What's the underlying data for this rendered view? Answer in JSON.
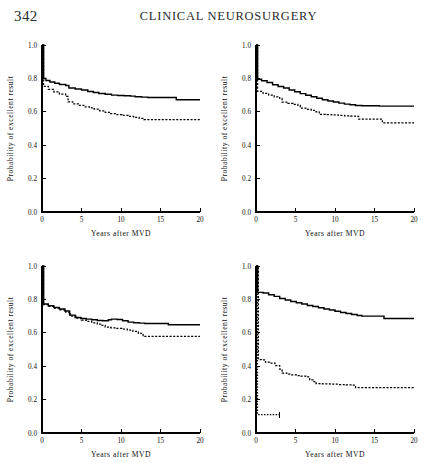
{
  "header": {
    "folio": "342",
    "running_head": "CLINICAL NEUROSURGERY"
  },
  "axes": {
    "xlabel": "Years after MVD",
    "ylabel": "Probability of excellent result",
    "xticks": [
      "0",
      "5",
      "10",
      "15",
      "20"
    ],
    "yticks": [
      "0.0",
      "0.2",
      "0.4",
      "0.6",
      "0.8",
      "1.0"
    ],
    "xlim": [
      0,
      20
    ],
    "ylim": [
      0,
      1
    ]
  },
  "chart_data": [
    {
      "type": "line",
      "panel": "top-left",
      "title": "",
      "xlabel": "Years after MVD",
      "ylabel": "Probability of excellent result",
      "xlim": [
        0,
        20
      ],
      "ylim": [
        0,
        1
      ],
      "grid": false,
      "legend": "none",
      "series": [
        {
          "name": "curve-solid",
          "style": "solid",
          "x": [
            0,
            0.2,
            0.5,
            1.0,
            1.6,
            2.2,
            3.0,
            3.4,
            4.2,
            5.0,
            5.8,
            6.5,
            7.2,
            8.0,
            8.8,
            9.6,
            10.4,
            11.2,
            11.8,
            12.6,
            13.4,
            15.6,
            17.0,
            20.0
          ],
          "y": [
            1.0,
            0.8,
            0.787,
            0.779,
            0.771,
            0.764,
            0.757,
            0.742,
            0.737,
            0.73,
            0.722,
            0.716,
            0.71,
            0.705,
            0.7,
            0.698,
            0.696,
            0.694,
            0.69,
            0.688,
            0.686,
            0.686,
            0.672,
            0.672
          ]
        },
        {
          "name": "curve-dashed",
          "style": "dashed",
          "x": [
            0,
            0.2,
            0.8,
            1.5,
            2.2,
            3.0,
            3.3,
            3.9,
            4.6,
            5.3,
            6.0,
            6.6,
            7.3,
            8.0,
            8.7,
            9.4,
            10.1,
            10.9,
            11.6,
            12.3,
            12.9,
            13.4,
            20.0
          ],
          "y": [
            1.0,
            0.752,
            0.735,
            0.72,
            0.706,
            0.692,
            0.66,
            0.648,
            0.638,
            0.63,
            0.624,
            0.616,
            0.606,
            0.597,
            0.589,
            0.583,
            0.578,
            0.572,
            0.566,
            0.56,
            0.553,
            0.553,
            0.553
          ]
        }
      ]
    },
    {
      "type": "line",
      "panel": "top-right",
      "title": "",
      "xlabel": "Years after MVD",
      "ylabel": "Probability of excellent result",
      "xlim": [
        0,
        20
      ],
      "ylim": [
        0,
        1
      ],
      "grid": false,
      "legend": "none",
      "series": [
        {
          "name": "curve-solid",
          "style": "solid",
          "x": [
            0,
            0.2,
            0.7,
            1.4,
            2.1,
            2.8,
            3.5,
            4.2,
            4.9,
            5.6,
            6.3,
            7.0,
            7.7,
            8.4,
            9.1,
            9.8,
            10.5,
            11.2,
            11.9,
            12.6,
            13.4,
            15.6,
            20.0
          ],
          "y": [
            1.0,
            0.795,
            0.786,
            0.775,
            0.762,
            0.751,
            0.742,
            0.731,
            0.72,
            0.709,
            0.699,
            0.69,
            0.681,
            0.672,
            0.665,
            0.659,
            0.652,
            0.646,
            0.642,
            0.638,
            0.636,
            0.634,
            0.634
          ]
        },
        {
          "name": "curve-dashed",
          "style": "dashed",
          "x": [
            0,
            0.2,
            0.9,
            1.6,
            2.3,
            3.0,
            3.3,
            4.0,
            4.7,
            5.3,
            5.6,
            6.3,
            7.0,
            7.6,
            8.0,
            8.8,
            9.6,
            10.4,
            11.2,
            12.0,
            12.7,
            13.0,
            15.6,
            16.0,
            20.0
          ],
          "y": [
            1.0,
            0.722,
            0.71,
            0.7,
            0.69,
            0.68,
            0.658,
            0.65,
            0.644,
            0.638,
            0.622,
            0.615,
            0.608,
            0.6,
            0.585,
            0.583,
            0.581,
            0.578,
            0.576,
            0.574,
            0.572,
            0.556,
            0.556,
            0.534,
            0.534
          ]
        }
      ]
    },
    {
      "type": "line",
      "panel": "bottom-left",
      "title": "",
      "xlabel": "Years after MVD",
      "ylabel": "Probability of excellent result",
      "xlim": [
        0,
        20
      ],
      "ylim": [
        0,
        1
      ],
      "grid": false,
      "legend": "none",
      "series": [
        {
          "name": "curve-solid",
          "style": "solid",
          "x": [
            0,
            0.2,
            0.8,
            1.5,
            2.2,
            2.9,
            3.5,
            4.2,
            4.9,
            5.6,
            6.3,
            7.0,
            7.7,
            8.4,
            8.8,
            9.5,
            10.2,
            10.9,
            11.6,
            12.3,
            13.0,
            15.6,
            16.0,
            20.0
          ],
          "y": [
            1.0,
            0.772,
            0.762,
            0.752,
            0.742,
            0.73,
            0.706,
            0.692,
            0.686,
            0.682,
            0.678,
            0.674,
            0.672,
            0.678,
            0.682,
            0.68,
            0.672,
            0.664,
            0.66,
            0.658,
            0.656,
            0.656,
            0.648,
            0.648
          ]
        },
        {
          "name": "curve-dashed",
          "style": "dashed",
          "x": [
            0,
            0.2,
            0.9,
            1.6,
            2.3,
            3.0,
            3.6,
            4.3,
            5.0,
            5.6,
            6.3,
            7.0,
            7.6,
            8.0,
            8.7,
            9.4,
            10.1,
            10.8,
            11.5,
            12.2,
            12.8,
            13.2,
            20.0
          ],
          "y": [
            1.0,
            0.768,
            0.758,
            0.748,
            0.738,
            0.724,
            0.7,
            0.688,
            0.676,
            0.668,
            0.66,
            0.652,
            0.644,
            0.634,
            0.63,
            0.626,
            0.622,
            0.616,
            0.608,
            0.596,
            0.578,
            0.578,
            0.578
          ]
        }
      ]
    },
    {
      "type": "line",
      "panel": "bottom-right",
      "title": "",
      "xlabel": "Years after MVD",
      "ylabel": "Probability of excellent result",
      "xlim": [
        0,
        20
      ],
      "ylim": [
        0,
        1
      ],
      "grid": false,
      "legend": "none",
      "series": [
        {
          "name": "curve-solid",
          "style": "solid",
          "x": [
            0,
            0.2,
            0.9,
            1.6,
            2.3,
            3.0,
            3.7,
            4.4,
            5.1,
            5.8,
            6.5,
            7.2,
            7.9,
            8.6,
            9.3,
            10.0,
            10.7,
            11.4,
            12.1,
            12.8,
            13.4,
            15.6,
            16.2,
            20.0
          ],
          "y": [
            1.0,
            0.842,
            0.838,
            0.828,
            0.818,
            0.806,
            0.796,
            0.788,
            0.78,
            0.772,
            0.764,
            0.757,
            0.75,
            0.743,
            0.736,
            0.729,
            0.722,
            0.716,
            0.71,
            0.704,
            0.7,
            0.7,
            0.686,
            0.686
          ]
        },
        {
          "name": "curve-dashed",
          "style": "dashed",
          "x": [
            0,
            0.3,
            0.7,
            1.2,
            1.8,
            2.4,
            3.0,
            3.3,
            3.9,
            4.5,
            5.1,
            5.7,
            6.3,
            6.8,
            7.2,
            7.6,
            8.4,
            9.4,
            10.4,
            11.4,
            12.2,
            12.6,
            20.0
          ],
          "y": [
            1.0,
            0.44,
            0.438,
            0.424,
            0.418,
            0.404,
            0.382,
            0.358,
            0.352,
            0.348,
            0.344,
            0.34,
            0.336,
            0.318,
            0.308,
            0.296,
            0.294,
            0.292,
            0.29,
            0.288,
            0.286,
            0.272,
            0.272
          ]
        },
        {
          "name": "curve-dotted-short",
          "style": "dotted",
          "x": [
            0,
            0.2,
            3.0
          ],
          "y": [
            1.0,
            0.11,
            0.11
          ]
        }
      ]
    }
  ]
}
